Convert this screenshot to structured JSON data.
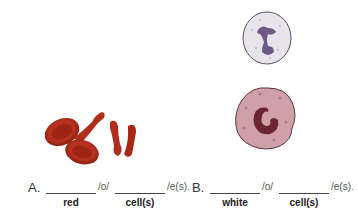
{
  "items": [
    {
      "letter": "A.",
      "blank1_label": "red",
      "middle_suffix": "/o/",
      "blank2_label": "cell(s)",
      "end_suffix": "/e(s)."
    },
    {
      "letter": "B.",
      "blank1_label": "white",
      "middle_suffix": "/o/",
      "blank2_label": "cell(s)",
      "end_suffix": "/e(s)."
    }
  ],
  "images": {
    "a": "red-blood-cells-illustration",
    "b_top": "neutrophil-illustration",
    "b_bottom": "monocyte-illustration"
  }
}
